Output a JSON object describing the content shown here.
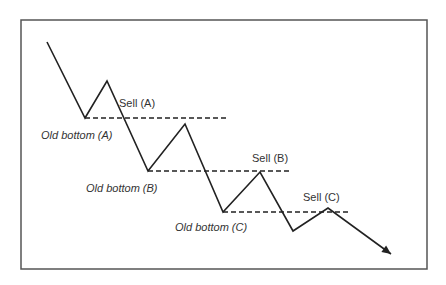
{
  "diagram": {
    "frame": {
      "x": 21,
      "y": 20,
      "width": 406,
      "height": 249,
      "color": "#555555"
    },
    "price_path": [
      [
        47,
        42
      ],
      [
        85,
        118
      ],
      [
        107,
        81
      ],
      [
        148,
        171
      ],
      [
        185,
        124
      ],
      [
        223,
        212
      ],
      [
        260,
        172
      ],
      [
        293,
        231
      ],
      [
        328,
        208
      ],
      [
        391,
        254
      ]
    ],
    "line_color": "#222222",
    "levels": [
      {
        "y": 118,
        "x1": 85,
        "x2": 227
      },
      {
        "y": 171,
        "x1": 148,
        "x2": 290
      },
      {
        "y": 212,
        "x1": 223,
        "x2": 350
      }
    ],
    "labels": {
      "sell_a": "Sell (A)",
      "sell_b": "Sell (B)",
      "sell_c": "Sell (C)",
      "bottom_a": "Old bottom (A)",
      "bottom_b": "Old bottom (B)",
      "bottom_c": "Old bottom (C)"
    }
  }
}
